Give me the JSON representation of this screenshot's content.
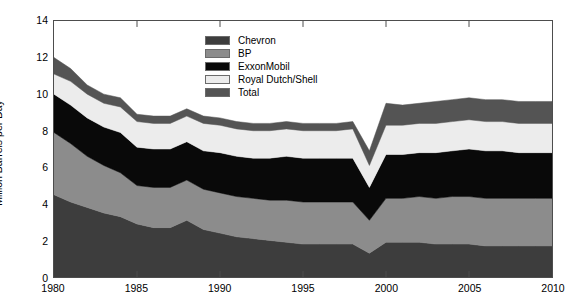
{
  "chart_data": {
    "type": "area",
    "stacked": true,
    "title": "",
    "xlabel": "",
    "ylabel": "Million Barrels per Day",
    "xlim": [
      1980,
      2010
    ],
    "ylim": [
      0,
      14
    ],
    "yticks": [
      0,
      2,
      4,
      6,
      8,
      10,
      12,
      14
    ],
    "xticks": [
      1980,
      1985,
      1990,
      1995,
      2000,
      2005,
      2010
    ],
    "grid": false,
    "legend_position": "top-center",
    "x": [
      1980,
      1981,
      1982,
      1983,
      1984,
      1985,
      1986,
      1987,
      1988,
      1989,
      1990,
      1991,
      1992,
      1993,
      1994,
      1995,
      1996,
      1997,
      1998,
      1999,
      2000,
      2001,
      2002,
      2003,
      2004,
      2005,
      2006,
      2007,
      2008,
      2009,
      2010
    ],
    "series": [
      {
        "name": "Chevron",
        "color": "#3d3d3d",
        "values": [
          4.5,
          4.1,
          3.8,
          3.5,
          3.3,
          2.9,
          2.7,
          2.7,
          3.1,
          2.6,
          2.4,
          2.2,
          2.1,
          2.0,
          1.9,
          1.8,
          1.8,
          1.8,
          1.8,
          1.3,
          1.9,
          1.9,
          1.9,
          1.8,
          1.8,
          1.8,
          1.7,
          1.7,
          1.7,
          1.7,
          1.7
        ]
      },
      {
        "name": "BP",
        "color": "#8c8c8c",
        "values": [
          3.4,
          3.2,
          2.8,
          2.6,
          2.4,
          2.1,
          2.2,
          2.2,
          2.2,
          2.2,
          2.2,
          2.2,
          2.2,
          2.2,
          2.3,
          2.3,
          2.3,
          2.3,
          2.3,
          1.8,
          2.4,
          2.4,
          2.5,
          2.5,
          2.6,
          2.6,
          2.6,
          2.6,
          2.6,
          2.6,
          2.6
        ]
      },
      {
        "name": "ExxonMobil",
        "color": "#090909",
        "values": [
          2.1,
          2.1,
          2.1,
          2.1,
          2.2,
          2.1,
          2.1,
          2.1,
          2.1,
          2.1,
          2.2,
          2.2,
          2.2,
          2.3,
          2.4,
          2.4,
          2.4,
          2.4,
          2.4,
          1.8,
          2.4,
          2.4,
          2.4,
          2.5,
          2.5,
          2.6,
          2.6,
          2.6,
          2.5,
          2.5,
          2.5
        ]
      },
      {
        "name": "Royal Dutch/Shell",
        "color": "#ececec",
        "values": [
          1.1,
          1.3,
          1.3,
          1.3,
          1.4,
          1.4,
          1.4,
          1.4,
          1.4,
          1.5,
          1.5,
          1.5,
          1.5,
          1.5,
          1.5,
          1.5,
          1.5,
          1.5,
          1.6,
          1.2,
          1.6,
          1.6,
          1.6,
          1.6,
          1.6,
          1.6,
          1.6,
          1.6,
          1.6,
          1.6,
          1.6
        ]
      },
      {
        "name": "Total",
        "color": "#545454",
        "values": [
          0.9,
          0.7,
          0.5,
          0.5,
          0.5,
          0.4,
          0.4,
          0.4,
          0.4,
          0.4,
          0.4,
          0.4,
          0.4,
          0.4,
          0.4,
          0.4,
          0.4,
          0.4,
          0.4,
          0.8,
          1.2,
          1.1,
          1.1,
          1.2,
          1.2,
          1.2,
          1.2,
          1.2,
          1.2,
          1.2,
          1.2
        ]
      }
    ],
    "totals": [
      12.0,
      11.4,
      10.5,
      10.0,
      9.8,
      8.9,
      8.8,
      8.8,
      9.2,
      8.8,
      8.7,
      8.5,
      8.4,
      8.4,
      8.5,
      8.4,
      8.4,
      8.4,
      8.5,
      6.9,
      9.5,
      9.4,
      9.5,
      9.6,
      9.7,
      9.8,
      9.7,
      9.7,
      9.6,
      9.6,
      9.6
    ]
  },
  "legend": {
    "items": [
      {
        "label": "Chevron"
      },
      {
        "label": "BP"
      },
      {
        "label": "ExxonMobil"
      },
      {
        "label": "Royal Dutch/Shell"
      },
      {
        "label": "Total"
      }
    ]
  }
}
